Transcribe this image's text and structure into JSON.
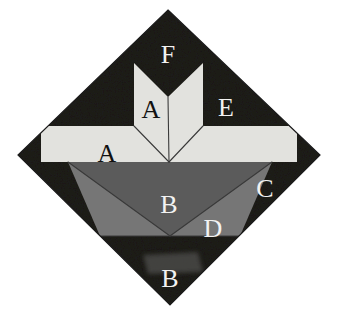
{
  "figure": {
    "background_color": "#ffffff",
    "outline_color": "#1b1b1b",
    "palette": {
      "dark": "#1c1b1a",
      "dark_alt": "#242322",
      "light": "#e2e2de",
      "light_alt": "#d9d9d4",
      "gray_mid": "#5b5b5b",
      "gray_light": "#767676",
      "gray_smudge": "#4a4846",
      "line": "#3a3a3a",
      "label_dark": "#111111",
      "label_light": "#f2f2f2"
    },
    "diamond": {
      "top": [
        168,
        10
      ],
      "left": [
        18,
        155
      ],
      "right": [
        320,
        155
      ],
      "bottom": [
        170,
        305
      ],
      "center": [
        169,
        162
      ]
    }
  },
  "labels": [
    {
      "id": "label-f",
      "text": "F",
      "x": 168,
      "y": 57,
      "tone": "light",
      "region": "top-notch-dark"
    },
    {
      "id": "label-a-upper",
      "text": "A",
      "x": 151,
      "y": 112,
      "tone": "dark",
      "region": "chevron-left-strip"
    },
    {
      "id": "label-e",
      "text": "E",
      "x": 226,
      "y": 110,
      "tone": "light",
      "region": "upper-right-dark"
    },
    {
      "id": "label-a-band",
      "text": "A",
      "x": 107,
      "y": 156,
      "tone": "dark",
      "region": "horizontal-light-band"
    },
    {
      "id": "label-b-mid",
      "text": "B",
      "x": 169,
      "y": 207,
      "tone": "light",
      "region": "center-gray-triangle"
    },
    {
      "id": "label-c",
      "text": "C",
      "x": 265,
      "y": 191,
      "tone": "light",
      "region": "right-dark-wedge"
    },
    {
      "id": "label-d",
      "text": "D",
      "x": 213,
      "y": 231,
      "tone": "light",
      "region": "lower-right-gray-triangle"
    },
    {
      "id": "label-b-bottom",
      "text": "B",
      "x": 170,
      "y": 281,
      "tone": "light",
      "region": "bottom-dark-triangle"
    }
  ],
  "regions": [
    {
      "id": "diamond-background",
      "name": "diamond-dark-ground",
      "fill": "#1c1b1a",
      "points": "168,10 320,155 170,305 18,155"
    },
    {
      "id": "chevron-upper-center",
      "name": "light-chevron",
      "fill": "#e2e2de",
      "points": "134,63 168,97 203,63 203,126 169,162 134,126"
    },
    {
      "id": "band-horizontal",
      "name": "horizontal-light-band",
      "fill": "#e2e2de",
      "points": "41,126 297,126 297,162 41,162"
    },
    {
      "id": "triangle-center-gray",
      "name": "center-gray-triangle",
      "fill": "#5b5b5b",
      "points": "68,162 272,162 170,236"
    },
    {
      "id": "triangle-left-gray-light",
      "name": "lower-left-gray-triangle",
      "fill": "#767676",
      "points": "68,162 170,236 100,236"
    },
    {
      "id": "triangle-right-gray-light",
      "name": "lower-right-gray-triangle",
      "fill": "#767676",
      "points": "272,162 170,236 240,236"
    },
    {
      "id": "smudge-bottom",
      "name": "bottom-smudge-patch",
      "fill": "#4a4846",
      "points": "143,255 198,252 203,272 148,274"
    }
  ],
  "dividers": [
    {
      "id": "div-chevron-left",
      "name": "chevron-left-fold",
      "x1": 134,
      "y1": 126,
      "x2": 169,
      "y2": 162
    },
    {
      "id": "div-chevron-right",
      "name": "chevron-right-fold",
      "x1": 203,
      "y1": 126,
      "x2": 169,
      "y2": 162
    },
    {
      "id": "div-chevron-spine",
      "name": "chevron-center-spine",
      "x1": 168,
      "y1": 97,
      "x2": 169,
      "y2": 162
    },
    {
      "id": "div-gray-left",
      "name": "gray-left-edge",
      "x1": 68,
      "y1": 162,
      "x2": 170,
      "y2": 236
    },
    {
      "id": "div-gray-right",
      "name": "gray-right-edge",
      "x1": 272,
      "y1": 162,
      "x2": 170,
      "y2": 236
    },
    {
      "id": "div-gray-base",
      "name": "gray-band-base",
      "x1": 100,
      "y1": 236,
      "x2": 240,
      "y2": 236
    }
  ]
}
